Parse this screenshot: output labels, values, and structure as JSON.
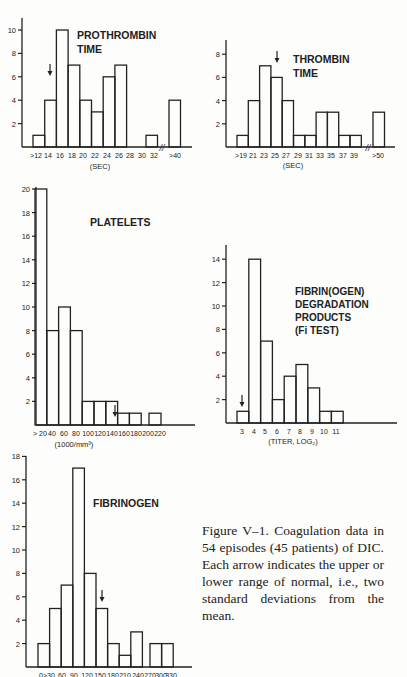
{
  "chart_data": [
    {
      "id": "prothrombin",
      "type": "bar",
      "title": "PROTHROMBIN TIME",
      "xlabel": "(SEC)",
      "ylabel": "",
      "categories": [
        ">12",
        "14",
        "16",
        "18",
        "20",
        "22",
        "24",
        "26",
        "28",
        "30",
        "32",
        ">40"
      ],
      "values": [
        1,
        4,
        10,
        7,
        4,
        3,
        6,
        7,
        0,
        0,
        1,
        4
      ],
      "yticks": [
        2,
        4,
        6,
        8,
        10
      ],
      "ylim": [
        0,
        11
      ],
      "axis_break_between": [
        "32",
        ">40"
      ],
      "normal_arrow_at": "14"
    },
    {
      "id": "thrombin",
      "type": "bar",
      "title": "THROMBIN TIME",
      "xlabel": "(SEC)",
      "ylabel": "",
      "categories": [
        ">19",
        "21",
        "23",
        "25",
        "27",
        "29",
        "31",
        "33",
        "35",
        "37",
        "39",
        ">50"
      ],
      "values": [
        1,
        4,
        7,
        6,
        4,
        1,
        1,
        3,
        3,
        1,
        1,
        3
      ],
      "yticks": [
        2,
        4,
        6,
        8
      ],
      "ylim": [
        0,
        9
      ],
      "axis_break_between": [
        "39",
        ">50"
      ],
      "normal_arrow_at": "25"
    },
    {
      "id": "platelets",
      "type": "bar",
      "title": "PLATELETS",
      "xlabel": "(1000/mm³)",
      "ylabel": "",
      "categories": [
        "> 20",
        "40",
        "60",
        "80",
        "100",
        "120",
        "140",
        "160",
        "180",
        "200",
        "220"
      ],
      "values": [
        20,
        8,
        10,
        8,
        2,
        2,
        2,
        1,
        1,
        0,
        1
      ],
      "yticks": [
        2,
        4,
        6,
        8,
        10,
        12,
        14,
        16,
        18,
        20
      ],
      "ylim": [
        0,
        20
      ],
      "normal_arrow_at": "150"
    },
    {
      "id": "fdp",
      "type": "bar",
      "title": "FIBRIN(OGEN) DEGRADATION PRODUCTS (Fi TEST)",
      "title_lines": [
        "FIBRIN(OGEN)",
        "DEGRADATION",
        "PRODUCTS",
        "(Fi TEST)"
      ],
      "xlabel": "(TITER, LOG₂)",
      "ylabel": "",
      "categories": [
        "3",
        "4",
        "5",
        "6",
        "7",
        "8",
        "9",
        "10",
        "11"
      ],
      "values": [
        1,
        14,
        7,
        2,
        4,
        5,
        3,
        1,
        1
      ],
      "yticks": [
        2,
        4,
        6,
        8,
        10,
        12,
        14
      ],
      "ylim": [
        0,
        15
      ],
      "normal_arrow_at": "3"
    },
    {
      "id": "fibrinogen",
      "type": "bar",
      "title": "FIBRINOGEN",
      "xlabel": "",
      "ylabel": "",
      "categories": [
        "0>30",
        "60",
        "90",
        "120",
        "150",
        "180",
        "210",
        "240",
        "270",
        "300",
        "330"
      ],
      "values": [
        2,
        5,
        7,
        17,
        8,
        5,
        2,
        1,
        3,
        0,
        2,
        2
      ],
      "yticks": [
        2,
        4,
        6,
        8,
        10,
        12,
        14,
        16,
        18
      ],
      "ylim": [
        0,
        18
      ],
      "normal_arrow_at": "150"
    }
  ],
  "labels": {
    "prothrombin": {
      "title1": "PROTHROMBIN",
      "title2": "TIME",
      "xlabel": "(SEC)"
    },
    "thrombin": {
      "title1": "THROMBIN",
      "title2": "TIME",
      "xlabel": "(SEC)"
    },
    "platelets": {
      "title1": "PLATELETS",
      "xlabel": "(1000/mm³)"
    },
    "fdp": {
      "title1": "FIBRIN(OGEN)",
      "title2": "DEGRADATION",
      "title3": "PRODUCTS",
      "title4": "(Fi TEST)",
      "xlabel": "(TITER, LOG₂)"
    },
    "fibrinogen": {
      "title1": "FIBRINOGEN"
    }
  },
  "caption": "Figure V–1. Coagulation data in 54 episodes (45 patients) of DIC. Each arrow indicates the upper or lower range of normal, i.e., two standard deviations from the mean."
}
